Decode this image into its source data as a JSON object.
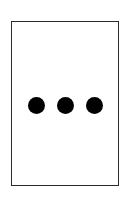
{
  "canvas": {
    "width": 131,
    "height": 198,
    "background_color": "#ffffff"
  },
  "panel": {
    "name": "bordered-panel",
    "x": 11,
    "y": 21,
    "width": 108,
    "height": 165,
    "fill_color": "#ffffff",
    "border_color": "#2b2b2b",
    "border_width": 1.5
  },
  "ellipsis": {
    "label": "...",
    "icon_name": "ellipsis-icon",
    "dot_count": 3,
    "dot_color": "#000000",
    "dot_diameter": 17,
    "dot_gap": 12,
    "center_y": 104,
    "dots": [
      {
        "name": "dot-1",
        "center_x": 39,
        "center_y": 104
      },
      {
        "name": "dot-2",
        "center_x": 68,
        "center_y": 104
      },
      {
        "name": "dot-3",
        "center_x": 96,
        "center_y": 104
      }
    ]
  }
}
